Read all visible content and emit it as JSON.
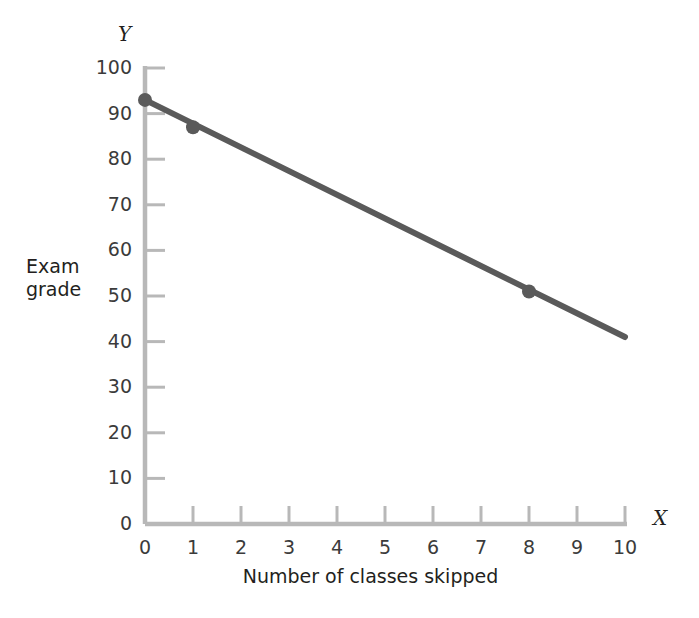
{
  "chart_data": {
    "type": "line",
    "title": "",
    "subtitle": "",
    "xlabel": "Number of classes skipped",
    "ylabel": "Exam grade",
    "x_axis_letter": "X",
    "y_axis_letter": "Y",
    "xlim": [
      0,
      10
    ],
    "ylim": [
      0,
      100
    ],
    "xticks": [
      0,
      1,
      2,
      3,
      4,
      5,
      6,
      7,
      8,
      9,
      10
    ],
    "yticks": [
      0,
      10,
      20,
      30,
      40,
      50,
      60,
      70,
      80,
      90,
      100
    ],
    "xtick_labels": [
      "0",
      "1",
      "2",
      "3",
      "4",
      "5",
      "6",
      "7",
      "8",
      "9",
      "10"
    ],
    "ytick_labels": [
      "0",
      "10",
      "20",
      "30",
      "40",
      "50",
      "60",
      "70",
      "80",
      "90",
      "100"
    ],
    "grid": false,
    "legend": false,
    "legend_position": "none",
    "series": [
      {
        "name": "Exam grade vs classes skipped",
        "x": [
          0,
          10
        ],
        "y": [
          93,
          41
        ],
        "line_color": "#5a5a5a",
        "line_width": 6
      }
    ],
    "markers": [
      {
        "x": 0,
        "y": 93,
        "label": ""
      },
      {
        "x": 1,
        "y": 87,
        "label": ""
      },
      {
        "x": 8,
        "y": 51,
        "label": ""
      }
    ],
    "marker_color": "#5a5a5a",
    "marker_radius": 7,
    "axis_color": "#b8b8b8",
    "text_color": "#231f20",
    "background_color": "#ffffff"
  },
  "layout": {
    "plot_left_px": 145,
    "plot_bottom_px": 524,
    "plot_right_px": 625,
    "plot_top_px": 68
  }
}
